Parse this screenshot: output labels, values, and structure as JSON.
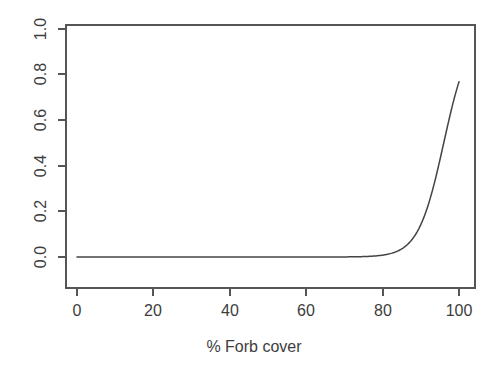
{
  "chart_data": {
    "type": "line",
    "title": "",
    "subtitle": "",
    "xlabel": "% Forb cover",
    "ylabel": "",
    "xlim": [
      0,
      100
    ],
    "ylim": [
      0.0,
      1.0
    ],
    "grid": false,
    "legend": "none",
    "xticks": [
      0,
      20,
      40,
      60,
      80,
      100
    ],
    "xtick_labels": [
      "0",
      "20",
      "40",
      "60",
      "80",
      "100"
    ],
    "yticks": [
      0.0,
      0.2,
      0.4,
      0.6,
      0.8,
      1.0
    ],
    "ytick_labels": [
      "0.0",
      "0.2",
      "0.4",
      "0.6",
      "0.8",
      "1.0"
    ],
    "series": [
      {
        "name": "fitted logistic response",
        "color": "#444444",
        "x": [
          0,
          5,
          10,
          15,
          20,
          25,
          30,
          35,
          40,
          45,
          50,
          55,
          60,
          62,
          64,
          66,
          68,
          70,
          72,
          74,
          76,
          78,
          80,
          82,
          84,
          86,
          88,
          90,
          91,
          92,
          93,
          94,
          95,
          96,
          97,
          98,
          99,
          100
        ],
        "y": [
          0.0,
          0.0,
          0.0,
          0.0,
          0.0,
          0.001,
          0.001,
          0.001,
          0.002,
          0.002,
          0.003,
          0.004,
          0.006,
          0.007,
          0.008,
          0.009,
          0.01,
          0.012,
          0.014,
          0.016,
          0.019,
          0.023,
          0.029,
          0.038,
          0.051,
          0.071,
          0.103,
          0.156,
          0.193,
          0.238,
          0.292,
          0.355,
          0.426,
          0.5,
          0.574,
          0.645,
          0.708,
          0.762
        ]
      }
    ],
    "curve_model": {
      "form": "logistic",
      "midpoint": 96,
      "slope": 0.3
    }
  },
  "axis_label": {
    "x_title": "% Forb cover"
  },
  "colors": {
    "background": "#ffffff",
    "axis": "#555555",
    "curve": "#444444",
    "text": "#3d3d3d"
  }
}
